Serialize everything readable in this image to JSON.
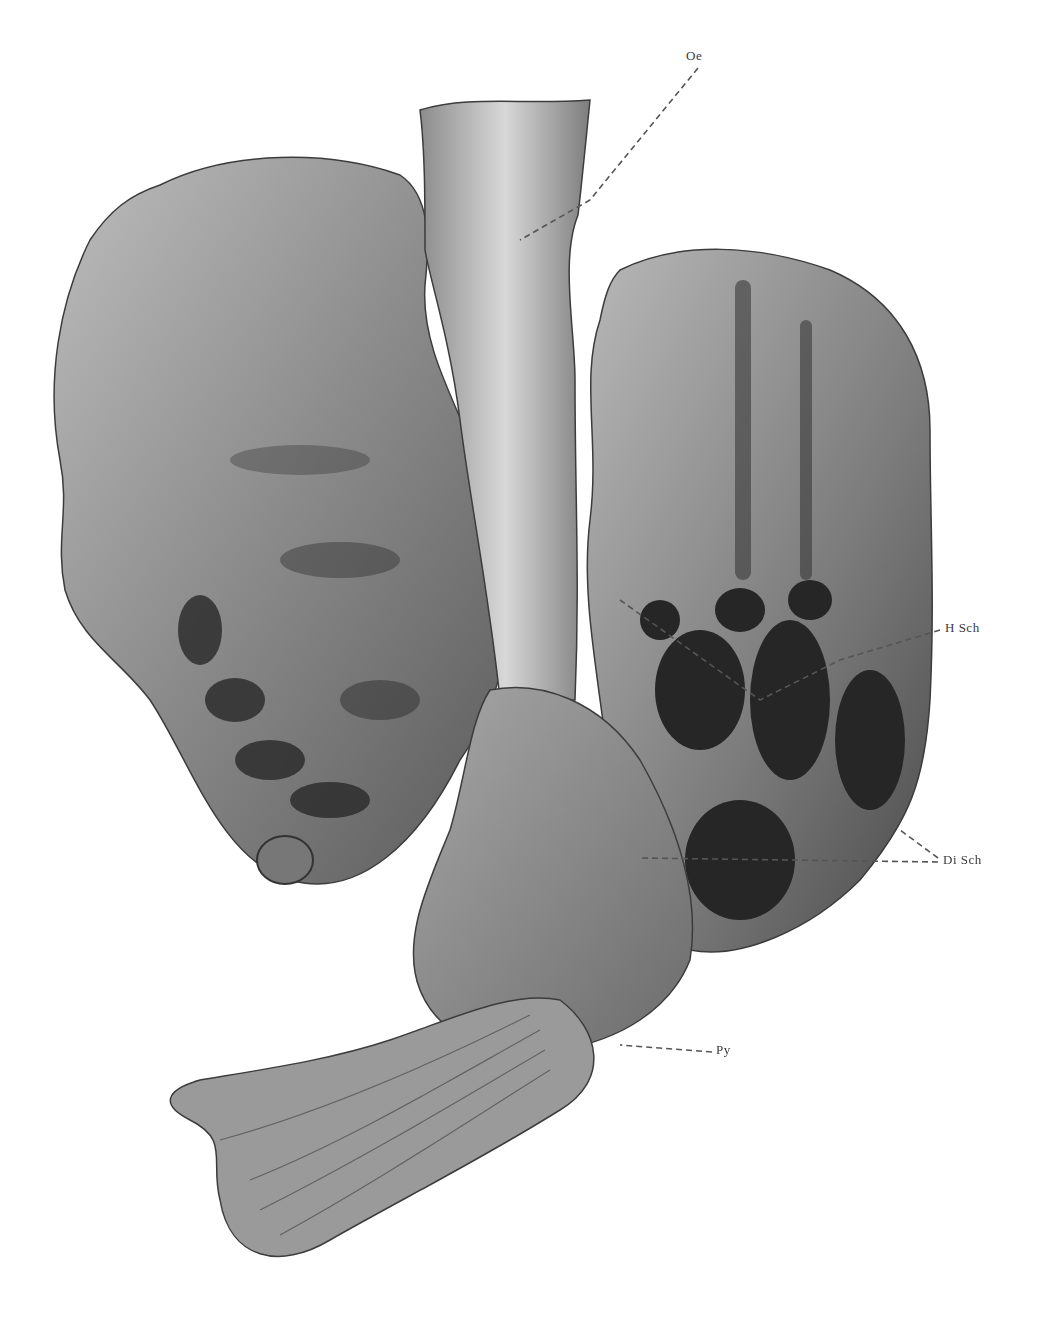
{
  "figure": {
    "labels": [
      {
        "id": "oe",
        "text": "Oe",
        "x": 693,
        "y": 57
      },
      {
        "id": "h-sch",
        "text": "H Sch",
        "x": 945,
        "y": 626
      },
      {
        "id": "di-sch",
        "text": "Di Sch",
        "x": 943,
        "y": 860
      },
      {
        "id": "py",
        "text": "Py",
        "x": 716,
        "y": 1048
      }
    ],
    "colors": {
      "background": "#ffffff",
      "tissue_light": "#c9c9c9",
      "tissue_mid": "#8f8f8f",
      "tissue_dark": "#2b2b2b",
      "leader_line": "#555555",
      "label_text": "#3a3a3a"
    }
  }
}
